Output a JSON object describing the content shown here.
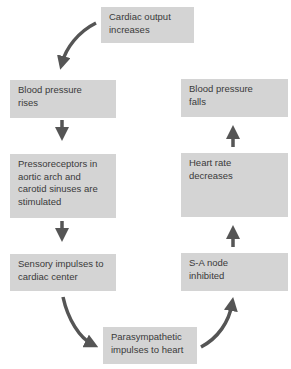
{
  "diagram": {
    "nodes": [
      {
        "id": "cardiac-output",
        "label": "Cardiac output\nincreases"
      },
      {
        "id": "bp-rises",
        "label": "Blood pressure\nrises"
      },
      {
        "id": "pressoreceptors",
        "label": "Pressoreceptors in\naortic arch and\ncarotid sinuses are\nstimulated"
      },
      {
        "id": "sensory-impulses",
        "label": "Sensory impulses to\ncardiac center"
      },
      {
        "id": "parasympathetic",
        "label": "Parasympathetic\nimpulses to heart"
      },
      {
        "id": "sa-node",
        "label": "S-A node\ninhibited"
      },
      {
        "id": "heart-rate",
        "label": "Heart rate\ndecreases"
      },
      {
        "id": "bp-falls",
        "label": "Blood pressure\nfalls"
      }
    ],
    "edges": [
      {
        "from": "cardiac-output",
        "to": "bp-rises",
        "style": "curved"
      },
      {
        "from": "bp-rises",
        "to": "pressoreceptors",
        "style": "straight"
      },
      {
        "from": "pressoreceptors",
        "to": "sensory-impulses",
        "style": "straight"
      },
      {
        "from": "sensory-impulses",
        "to": "parasympathetic",
        "style": "curved"
      },
      {
        "from": "parasympathetic",
        "to": "sa-node",
        "style": "curved"
      },
      {
        "from": "sa-node",
        "to": "heart-rate",
        "style": "straight"
      },
      {
        "from": "heart-rate",
        "to": "bp-falls",
        "style": "straight"
      }
    ],
    "colors": {
      "box": "#d4d4d4",
      "arrow": "#555555",
      "text": "#3a3a3a"
    }
  }
}
